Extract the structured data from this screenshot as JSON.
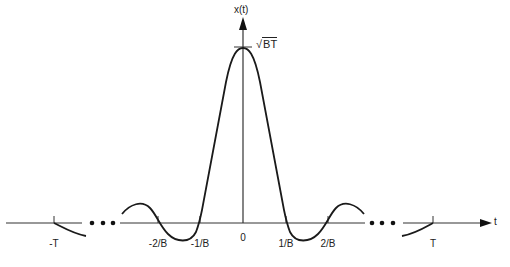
{
  "diagram": {
    "type": "signal-plot",
    "y_axis_label": "x(t)",
    "x_axis_label": "t",
    "peak_label": {
      "symbol": "√",
      "radicand": "BT"
    },
    "ticks": [
      {
        "label": "-T",
        "x": 54
      },
      {
        "label": "-2/B",
        "x": 158
      },
      {
        "label": "-1/B",
        "x": 200
      },
      {
        "label": "0",
        "x": 243
      },
      {
        "label": "1/B",
        "x": 286
      },
      {
        "label": "2/B",
        "x": 328
      },
      {
        "label": "T",
        "x": 433
      }
    ],
    "ellipsis": "• • •",
    "colors": {
      "stroke": "#1a1a1a",
      "axis": "#333333",
      "text": "#222222"
    }
  }
}
